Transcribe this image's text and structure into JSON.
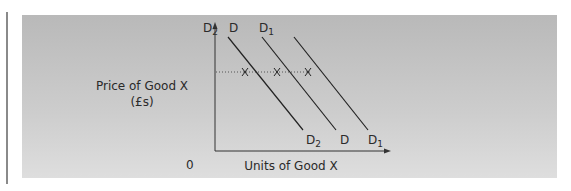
{
  "diagram": {
    "type": "demand-shift",
    "y_axis_label_line1": "Price of Good X",
    "y_axis_label_line2": "(£s)",
    "x_axis_label": "Units of Good X",
    "origin_label": "0",
    "curves": [
      {
        "name": "D2",
        "base": "D",
        "sub": "2",
        "position": "left"
      },
      {
        "name": "D",
        "base": "D",
        "sub": "",
        "position": "original"
      },
      {
        "name": "D1",
        "base": "D",
        "sub": "1",
        "position": "right"
      }
    ],
    "price_line": "dotted",
    "intersections": 3
  }
}
